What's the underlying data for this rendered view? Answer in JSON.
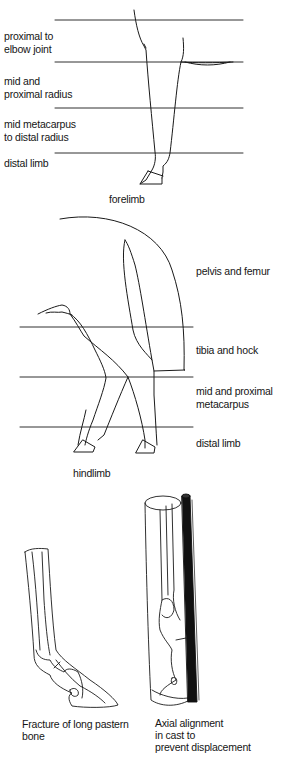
{
  "forelimb": {
    "caption": "forelimb",
    "zones": [
      {
        "line1": "proximal to",
        "line2": "elbow joint"
      },
      {
        "line1": "mid and",
        "line2": "proximal radius"
      },
      {
        "line1": "mid metacarpus",
        "line2": "to distal radius"
      },
      {
        "line1": "distal limb",
        "line2": ""
      }
    ]
  },
  "hindlimb": {
    "caption": "hindlimb",
    "zones": [
      {
        "line1": "pelvis and femur",
        "line2": ""
      },
      {
        "line1": "tibia and hock",
        "line2": ""
      },
      {
        "line1": "mid and proximal",
        "line2": "metacarpus"
      },
      {
        "line1": "distal limb",
        "line2": ""
      }
    ]
  },
  "fracture_figure": {
    "caption_line1": "Fracture of long pastern",
    "caption_line2": "bone"
  },
  "cast_figure": {
    "caption_line1": "Axial alignment",
    "caption_line2": "in cast to",
    "caption_line3": "prevent displacement"
  },
  "colors": {
    "line": "#1a1a1a",
    "background": "#ffffff",
    "splint": "#111111"
  }
}
